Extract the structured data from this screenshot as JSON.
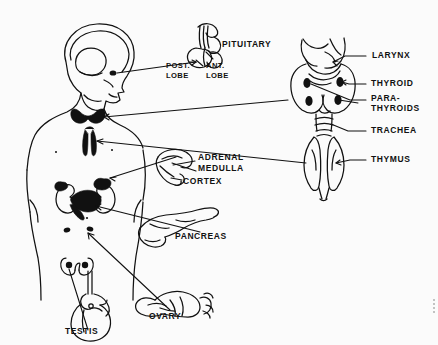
{
  "figure": {
    "type": "anatomical-line-diagram",
    "background_color": "#fbfbfb",
    "ink_color": "#111111"
  },
  "labels": {
    "pituitary": "PITUITARY",
    "post_lobe_line1": "POST.",
    "post_lobe_line2": "LOBE",
    "ant_lobe_line1": "ANT.",
    "ant_lobe_line2": "LOBE",
    "larynx": "LARYNX",
    "thyroid": "THYROID",
    "parathyroids_line1": "PARA-",
    "parathyroids_line2": "THYROIDS",
    "trachea": "TRACHEA",
    "thymus": "THYMUS",
    "adrenal": "ADRENAL",
    "medulla": "MEDULLA",
    "cortex": "CORTEX",
    "pancreas": "PANCREAS",
    "ovary": "OVARY",
    "testis": "TESTIS"
  },
  "label_positions": {
    "pituitary": {
      "x": 222,
      "y": 40
    },
    "post_lobe": {
      "x": 166,
      "y": 66
    },
    "ant_lobe": {
      "x": 206,
      "y": 66
    },
    "larynx": {
      "x": 378,
      "y": 56
    },
    "thyroid": {
      "x": 378,
      "y": 84
    },
    "parathyroids": {
      "x": 373,
      "y": 102
    },
    "trachea": {
      "x": 378,
      "y": 131
    },
    "thymus": {
      "x": 378,
      "y": 160
    },
    "adrenal": {
      "x": 198,
      "y": 158
    },
    "medulla": {
      "x": 198,
      "y": 169
    },
    "cortex": {
      "x": 183,
      "y": 182
    },
    "pancreas": {
      "x": 175,
      "y": 236
    },
    "ovary": {
      "x": 149,
      "y": 316
    },
    "testis": {
      "x": 65,
      "y": 330
    }
  },
  "structures": [
    {
      "name": "head-and-torso-figure",
      "side": "left"
    },
    {
      "name": "brain-outline",
      "side": "left"
    },
    {
      "name": "pituitary-gland-detail",
      "side": "top-center"
    },
    {
      "name": "thyroid-gland-in-body",
      "side": "left"
    },
    {
      "name": "thymus-in-body",
      "side": "left"
    },
    {
      "name": "kidneys-and-adrenals",
      "side": "left"
    },
    {
      "name": "pancreas-in-body",
      "side": "left"
    },
    {
      "name": "ovaries-in-body",
      "side": "left"
    },
    {
      "name": "larynx-thyroid-trachea-thymus-detail",
      "side": "right"
    },
    {
      "name": "adrenal-gland-detail",
      "side": "center"
    },
    {
      "name": "pancreas-detail",
      "side": "center"
    },
    {
      "name": "ovary-detail",
      "side": "bottom-center"
    },
    {
      "name": "testis-detail",
      "side": "bottom-left"
    }
  ]
}
